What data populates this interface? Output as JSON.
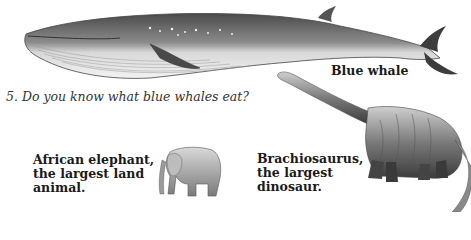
{
  "page": {
    "question": "5. Do you know what blue whales eat?",
    "illustrations": [
      {
        "id": "blue-whale",
        "label": "Blue whale"
      },
      {
        "id": "brachiosaurus",
        "label_lines": [
          "Brachiosaurus,",
          "the largest",
          "dinosaur."
        ]
      },
      {
        "id": "african-elephant",
        "label_lines": [
          "African elephant,",
          "the largest land",
          "animal."
        ]
      }
    ]
  },
  "colors": {
    "background": "#ffffff",
    "text": "#1a1a1a",
    "illustration_dark": "#3a3a3a",
    "illustration_mid": "#8a8a8a",
    "illustration_light": "#e6e6e6"
  }
}
